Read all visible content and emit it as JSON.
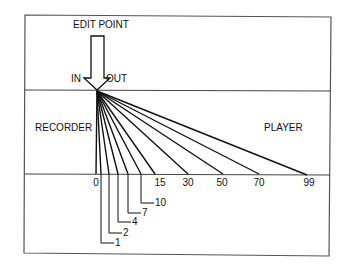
{
  "title": "EDIT POINT",
  "arrow": {
    "left_label": "IN",
    "right_label": "OUT"
  },
  "regions": {
    "left": "RECORDER",
    "right": "PLAYER"
  },
  "colors": {
    "line": "#111111",
    "frame": "#555555",
    "background": "#ffffff"
  },
  "fan_origin": {
    "x": 97,
    "y": 91
  },
  "baseline_y": 174,
  "top_divider_y": 90,
  "fan_lines": [
    {
      "value": "0",
      "x": 96,
      "label_position": "above-baseline"
    },
    {
      "value": "1",
      "x": 101,
      "label_position": "leader",
      "leader_y": 243
    },
    {
      "value": "2",
      "x": 109,
      "label_position": "leader",
      "leader_y": 233
    },
    {
      "value": "4",
      "x": 118,
      "label_position": "leader",
      "leader_y": 222
    },
    {
      "value": "7",
      "x": 128,
      "label_position": "leader",
      "leader_y": 213
    },
    {
      "value": "10",
      "x": 141,
      "label_position": "leader",
      "leader_y": 203
    },
    {
      "value": "15",
      "x": 155,
      "label_position": "below-baseline"
    },
    {
      "value": "30",
      "x": 188,
      "label_position": "below-baseline"
    },
    {
      "value": "50",
      "x": 223,
      "label_position": "below-baseline"
    },
    {
      "value": "70",
      "x": 259,
      "label_position": "below-baseline"
    },
    {
      "value": "99",
      "x": 307,
      "label_position": "below-baseline"
    }
  ],
  "labels": {
    "v0": "0",
    "v1": "1",
    "v2": "2",
    "v4": "4",
    "v7": "7",
    "v10": "10",
    "v15": "15",
    "v30": "30",
    "v50": "50",
    "v70": "70",
    "v99": "99"
  }
}
